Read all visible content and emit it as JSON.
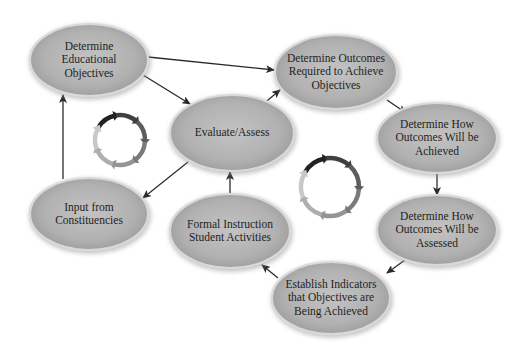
{
  "diagram": {
    "type": "cyclic-flow",
    "colors": {
      "background": "#ffffff",
      "node_fill_center": "#bdbdbd",
      "node_fill_edge": "#9a9a9a",
      "node_rim": "#d9d9d9",
      "arrow": "#2a2a2a",
      "cycle_dark": "#222222",
      "cycle_mid": "#7a7a7a",
      "cycle_light": "#c8c8c8"
    },
    "nodes": [
      {
        "id": "educational-objectives",
        "lines": [
          "Determine",
          "Educational",
          "Objectives"
        ],
        "cx": 89,
        "cy": 60,
        "rx": 59,
        "ry": 36
      },
      {
        "id": "outcomes-required",
        "lines": [
          "Determine Outcomes",
          "Required to Achieve",
          "Objectives"
        ],
        "cx": 336,
        "cy": 72,
        "rx": 61,
        "ry": 37
      },
      {
        "id": "outcomes-achieved",
        "lines": [
          "Determine How",
          "Outcomes Will be",
          "Achieved"
        ],
        "cx": 437,
        "cy": 138,
        "rx": 60,
        "ry": 35
      },
      {
        "id": "outcomes-assessed",
        "lines": [
          "Determine How",
          "Outcomes Will be",
          "Assessed"
        ],
        "cx": 437,
        "cy": 230,
        "rx": 60,
        "ry": 35
      },
      {
        "id": "establish-indicators",
        "lines": [
          "Establish Indicators",
          "that Objectives are",
          "Being Achieved"
        ],
        "cx": 331,
        "cy": 298,
        "rx": 59,
        "ry": 36
      },
      {
        "id": "formal-instruction",
        "lines": [
          "Formal Instruction",
          "Student Activities"
        ],
        "cx": 230,
        "cy": 231,
        "rx": 60,
        "ry": 37
      },
      {
        "id": "evaluate-assess",
        "lines": [
          "Evaluate/Assess"
        ],
        "cx": 232,
        "cy": 133,
        "rx": 62,
        "ry": 38
      },
      {
        "id": "input-constituencies",
        "lines": [
          "Input from",
          "Constituencies"
        ],
        "cx": 89,
        "cy": 214,
        "rx": 59,
        "ry": 36
      }
    ],
    "edges": [
      {
        "from": "educational-objectives",
        "to": "outcomes-required",
        "x1": 148,
        "y1": 57,
        "x2": 274,
        "y2": 70
      },
      {
        "from": "educational-objectives",
        "to": "evaluate-assess",
        "x1": 143,
        "y1": 75,
        "x2": 190,
        "y2": 104
      },
      {
        "from": "evaluate-assess",
        "to": "outcomes-required",
        "x1": 262,
        "y1": 105,
        "x2": 280,
        "y2": 90
      },
      {
        "from": "outcomes-required",
        "to": "outcomes-achieved",
        "x1": 387,
        "y1": 100,
        "x2": 406,
        "y2": 113
      },
      {
        "from": "outcomes-achieved",
        "to": "outcomes-assessed",
        "x1": 437,
        "y1": 173,
        "x2": 437,
        "y2": 195
      },
      {
        "from": "outcomes-assessed",
        "to": "establish-indicators",
        "x1": 405,
        "y1": 260,
        "x2": 387,
        "y2": 273
      },
      {
        "from": "establish-indicators",
        "to": "formal-instruction",
        "x1": 278,
        "y1": 278,
        "x2": 262,
        "y2": 265
      },
      {
        "from": "formal-instruction",
        "to": "evaluate-assess",
        "x1": 230,
        "y1": 195,
        "x2": 230,
        "y2": 172
      },
      {
        "from": "evaluate-assess",
        "to": "input-constituencies",
        "x1": 188,
        "y1": 162,
        "x2": 143,
        "y2": 198
      },
      {
        "from": "input-constituencies",
        "to": "educational-objectives",
        "x1": 63,
        "y1": 179,
        "x2": 63,
        "y2": 95
      }
    ],
    "cycle_icons": [
      {
        "id": "cycle-left",
        "cx": 120,
        "cy": 140,
        "r": 25
      },
      {
        "id": "cycle-right",
        "cx": 330,
        "cy": 187,
        "r": 29
      }
    ]
  }
}
